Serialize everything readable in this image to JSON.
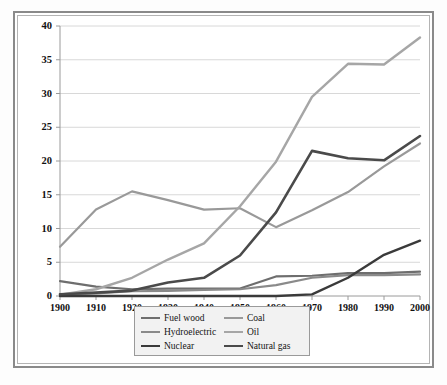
{
  "chart_data": {
    "type": "line",
    "title": "",
    "subtitle": "",
    "xlabel": "",
    "ylabel": "Quadrillion Btu",
    "xlim": [
      1900,
      2000
    ],
    "ylim": [
      0,
      40
    ],
    "ytick_step": 5,
    "grid": "horizontal",
    "legend_position": "bottom-center",
    "x": [
      1900,
      1910,
      1920,
      1930,
      1940,
      1950,
      1960,
      1970,
      1980,
      1990,
      2000
    ],
    "categories": [
      "1900",
      "1910",
      "1920",
      "1930",
      "1940",
      "1950",
      "1960",
      "1970",
      "1980",
      "1990",
      "2000"
    ],
    "yticks": [
      "0",
      "5",
      "10",
      "15",
      "20",
      "25",
      "30",
      "35",
      "40"
    ],
    "series": [
      {
        "name": "Fuel wood",
        "color": "#6e6e6e",
        "width": 2.2,
        "values": [
          2.2,
          1.4,
          1.0,
          1.1,
          1.1,
          1.1,
          2.9,
          3.0,
          3.4,
          3.4,
          3.6
        ]
      },
      {
        "name": "Coal",
        "color": "#999999",
        "width": 2.2,
        "values": [
          7.3,
          12.8,
          15.5,
          14.2,
          12.8,
          13.0,
          10.2,
          12.7,
          15.4,
          19.2,
          22.6
        ]
      },
      {
        "name": "Hydroelectric",
        "color": "#8a8a8a",
        "width": 2.2,
        "values": [
          0.25,
          0.4,
          0.7,
          0.75,
          0.9,
          1.0,
          1.6,
          2.7,
          3.1,
          3.1,
          3.2
        ]
      },
      {
        "name": "Oil",
        "color": "#a6a6a6",
        "width": 2.4,
        "values": [
          0.2,
          1.0,
          2.7,
          5.4,
          7.8,
          13.3,
          19.9,
          29.5,
          34.4,
          34.3,
          38.3
        ]
      },
      {
        "name": "Nuclear",
        "color": "#3a3a3a",
        "width": 2.4,
        "values": [
          0.0,
          0.0,
          0.0,
          0.0,
          0.0,
          0.0,
          0.0,
          0.24,
          2.7,
          6.1,
          8.2
        ]
      },
      {
        "name": "Natural gas",
        "color": "#4a4a4a",
        "width": 2.6,
        "values": [
          0.25,
          0.5,
          0.8,
          2.0,
          2.7,
          6.0,
          12.4,
          21.5,
          20.4,
          20.1,
          23.7
        ]
      }
    ]
  },
  "legend": {
    "entries": [
      {
        "label": "Fuel wood",
        "series": "Fuel wood"
      },
      {
        "label": "Coal",
        "series": "Coal"
      },
      {
        "label": "Hydroelectric",
        "series": "Hydroelectric"
      },
      {
        "label": "Oil",
        "series": "Oil"
      },
      {
        "label": "Nuclear",
        "series": "Nuclear"
      },
      {
        "label": "Natural gas",
        "series": "Natural gas"
      }
    ]
  },
  "colors": {
    "frame_outer": "#8a8a8a",
    "frame_inner": "#b4b4b4",
    "gridline": "#d8d8d8",
    "axis": "#9a9a9a",
    "text": "#111111",
    "legend_background": "#f2f2f2",
    "legend_border": "#9a9a9a",
    "plot_background": "#ffffff"
  }
}
